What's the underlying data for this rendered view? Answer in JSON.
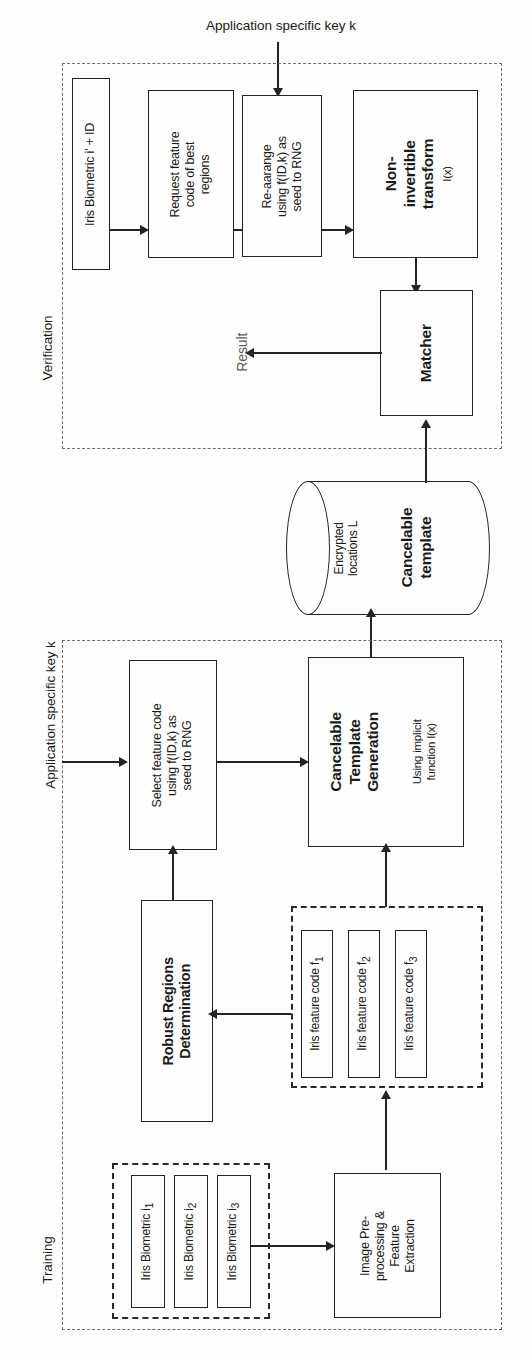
{
  "figure": {
    "orientation": "rotated-90",
    "line_color": "#242424",
    "dashed_section_color": "#6e6e6e"
  },
  "labels": {
    "app_key_top": "Application specific key k",
    "app_key_bottom": "Application specific key k",
    "verification_section": "Verification",
    "training_section": "Training",
    "result": "Result"
  },
  "verification": {
    "input_box": "Iris Biometric i' + ID",
    "request_box": "Request feature\ncode of best\nregions",
    "rearrange_box": "Re-aarange\nusing f(ID,k) as\nseed to RNG",
    "transform_box_title": "Non-\ninvertible\ntransform",
    "transform_box_sub": "I(x)",
    "matcher_box": "Matcher"
  },
  "storage": {
    "line1": "Encrypted",
    "line2": "locations L",
    "title1": "Cancelable",
    "title2": "template"
  },
  "training": {
    "select_box": "Select feature code\nusing f(ID,k) as\nseed to RNG",
    "ctg_title1": "Cancelable",
    "ctg_title2": "Template",
    "ctg_title3": "Generation",
    "ctg_sub1": "Using implicit",
    "ctg_sub2": "function I(x)",
    "robust_box_line1": "Robust Regions",
    "robust_box_line2": "Determination",
    "preprocess_box": "Image Pre-\nprocessing &\nFeature\nExtraction",
    "feature_codes": [
      {
        "label": "Iris feature code f",
        "sub": "1"
      },
      {
        "label": "Iris feature code f",
        "sub": "2"
      },
      {
        "label": "Iris feature code f",
        "sub": "3"
      }
    ],
    "biometrics": [
      {
        "label": "Iris Biometric i",
        "sub": "1"
      },
      {
        "label": "Iris Biometric i",
        "sub": "2"
      },
      {
        "label": "Iris Biometric i",
        "sub": "3"
      }
    ]
  }
}
